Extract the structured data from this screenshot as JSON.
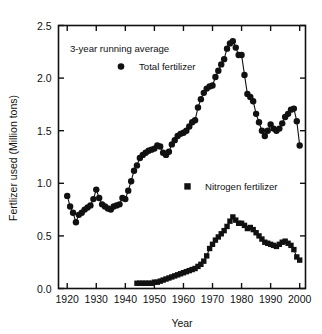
{
  "chart_data": {
    "type": "line",
    "title": "",
    "annotation": "3-year running average",
    "xlabel": "Year",
    "ylabel": "Fertlizer used (Million tons)",
    "xlim": [
      1917,
      2002
    ],
    "ylim": [
      0.0,
      2.5
    ],
    "xticks": [
      1920,
      1930,
      1940,
      1950,
      1960,
      1970,
      1980,
      1990,
      2000
    ],
    "xtick_labels": [
      "1920",
      "1930",
      "1940",
      "1950",
      "1960",
      "1970",
      "1980",
      "1990",
      "2000"
    ],
    "yticks": [
      0.0,
      0.5,
      1.0,
      1.5,
      2.0,
      2.5
    ],
    "ytick_labels": [
      "0.0",
      "0.5",
      "1.0",
      "1.5",
      "2.0",
      "2.5"
    ],
    "grid": false,
    "legend_position": "inside-upper-left",
    "marker_color": "#111111",
    "line_color": "#111111",
    "series": [
      {
        "name": "Total fertilizer",
        "marker": "circle",
        "x": [
          1920,
          1921,
          1922,
          1923,
          1924,
          1925,
          1926,
          1927,
          1928,
          1929,
          1930,
          1931,
          1932,
          1933,
          1934,
          1935,
          1936,
          1937,
          1938,
          1939,
          1940,
          1941,
          1942,
          1943,
          1944,
          1945,
          1946,
          1947,
          1948,
          1949,
          1950,
          1951,
          1952,
          1953,
          1954,
          1955,
          1956,
          1957,
          1958,
          1959,
          1960,
          1961,
          1962,
          1963,
          1964,
          1965,
          1966,
          1967,
          1968,
          1969,
          1970,
          1971,
          1972,
          1973,
          1974,
          1975,
          1976,
          1977,
          1978,
          1979,
          1980,
          1981,
          1982,
          1983,
          1984,
          1985,
          1986,
          1987,
          1988,
          1989,
          1990,
          1991,
          1992,
          1993,
          1994,
          1995,
          1996,
          1997,
          1998,
          1999,
          2000
        ],
        "y": [
          0.88,
          0.78,
          0.72,
          0.63,
          0.7,
          0.72,
          0.75,
          0.77,
          0.79,
          0.85,
          0.94,
          0.86,
          0.8,
          0.78,
          0.76,
          0.75,
          0.78,
          0.79,
          0.8,
          0.86,
          0.85,
          0.93,
          1.02,
          1.12,
          1.17,
          1.24,
          1.27,
          1.29,
          1.31,
          1.32,
          1.33,
          1.36,
          1.35,
          1.29,
          1.27,
          1.3,
          1.37,
          1.41,
          1.45,
          1.47,
          1.48,
          1.5,
          1.54,
          1.58,
          1.6,
          1.72,
          1.8,
          1.86,
          1.9,
          1.92,
          1.93,
          2.01,
          2.07,
          2.13,
          2.18,
          2.28,
          2.33,
          2.35,
          2.29,
          2.22,
          2.22,
          2.03,
          1.85,
          1.82,
          1.78,
          1.66,
          1.58,
          1.5,
          1.45,
          1.5,
          1.56,
          1.52,
          1.5,
          1.52,
          1.57,
          1.63,
          1.66,
          1.7,
          1.71,
          1.59,
          1.36
        ]
      },
      {
        "name": "Nitrogen fertilizer",
        "marker": "square",
        "x": [
          1944,
          1945,
          1946,
          1947,
          1948,
          1949,
          1950,
          1951,
          1952,
          1953,
          1954,
          1955,
          1956,
          1957,
          1958,
          1959,
          1960,
          1961,
          1962,
          1963,
          1964,
          1965,
          1966,
          1967,
          1968,
          1969,
          1970,
          1971,
          1972,
          1973,
          1974,
          1975,
          1976,
          1977,
          1978,
          1979,
          1980,
          1981,
          1982,
          1983,
          1984,
          1985,
          1986,
          1987,
          1988,
          1989,
          1990,
          1991,
          1992,
          1993,
          1994,
          1995,
          1996,
          1997,
          1998,
          1999,
          2000
        ],
        "y": [
          0.05,
          0.05,
          0.05,
          0.05,
          0.05,
          0.05,
          0.06,
          0.06,
          0.07,
          0.08,
          0.09,
          0.1,
          0.11,
          0.12,
          0.13,
          0.14,
          0.15,
          0.16,
          0.17,
          0.18,
          0.19,
          0.21,
          0.23,
          0.26,
          0.31,
          0.38,
          0.42,
          0.46,
          0.49,
          0.52,
          0.55,
          0.59,
          0.64,
          0.68,
          0.65,
          0.62,
          0.62,
          0.6,
          0.57,
          0.58,
          0.56,
          0.53,
          0.5,
          0.47,
          0.44,
          0.43,
          0.42,
          0.41,
          0.4,
          0.42,
          0.44,
          0.45,
          0.43,
          0.41,
          0.37,
          0.3,
          0.27
        ]
      }
    ]
  }
}
